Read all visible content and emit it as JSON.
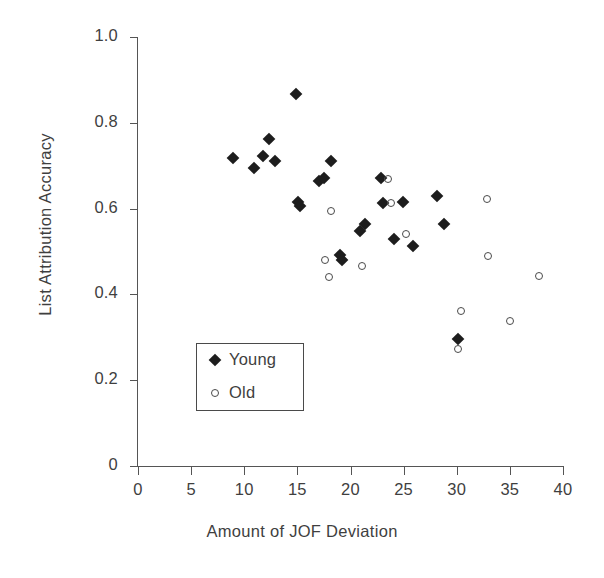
{
  "chart_data": {
    "type": "scatter",
    "title": "",
    "xlabel": "Amount of JOF Deviation",
    "ylabel": "List Attribution Accuracy",
    "xlim": [
      0,
      40
    ],
    "ylim": [
      0,
      1.0
    ],
    "xticks": [
      0,
      5,
      10,
      15,
      20,
      25,
      30,
      35,
      40
    ],
    "xtick_labels": [
      "0",
      "5",
      "10",
      "15",
      "20",
      "25",
      "30",
      "35",
      "40"
    ],
    "yticks": [
      0,
      0.2,
      0.4,
      0.6,
      0.8,
      1.0
    ],
    "ytick_labels": [
      "0",
      "0.2",
      "0.4",
      "0.6",
      "0.8",
      "1.0"
    ],
    "grid": false,
    "legend_position": "lower-left-inside",
    "series": [
      {
        "name": "Young",
        "marker": "filled-diamond",
        "color": "#1d1d1d",
        "points": [
          [
            8.9,
            0.719
          ],
          [
            10.9,
            0.694
          ],
          [
            11.8,
            0.722
          ],
          [
            12.3,
            0.763
          ],
          [
            12.9,
            0.71
          ],
          [
            14.9,
            0.868
          ],
          [
            15.1,
            0.615
          ],
          [
            15.2,
            0.605
          ],
          [
            17.0,
            0.664
          ],
          [
            17.5,
            0.672
          ],
          [
            18.2,
            0.711
          ],
          [
            19.0,
            0.492
          ],
          [
            19.2,
            0.481
          ],
          [
            20.9,
            0.547
          ],
          [
            21.4,
            0.563
          ],
          [
            22.9,
            0.671
          ],
          [
            23.1,
            0.612
          ],
          [
            24.1,
            0.528
          ],
          [
            24.9,
            0.615
          ],
          [
            25.9,
            0.512
          ],
          [
            28.1,
            0.63
          ],
          [
            28.8,
            0.565
          ],
          [
            30.1,
            0.295
          ]
        ]
      },
      {
        "name": "Old",
        "marker": "open-circle",
        "color": "#4a4a4a",
        "points": [
          [
            17.6,
            0.481
          ],
          [
            18.0,
            0.441
          ],
          [
            18.2,
            0.594
          ],
          [
            21.1,
            0.466
          ],
          [
            23.5,
            0.668
          ],
          [
            23.8,
            0.612
          ],
          [
            25.2,
            0.54
          ],
          [
            30.4,
            0.361
          ],
          [
            30.1,
            0.272
          ],
          [
            32.8,
            0.622
          ],
          [
            32.9,
            0.489
          ],
          [
            35.0,
            0.339
          ],
          [
            37.7,
            0.443
          ]
        ]
      }
    ]
  },
  "legend": {
    "entries": [
      {
        "label": "Young",
        "marker": "filled-diamond"
      },
      {
        "label": "Old",
        "marker": "open-circle"
      }
    ]
  }
}
